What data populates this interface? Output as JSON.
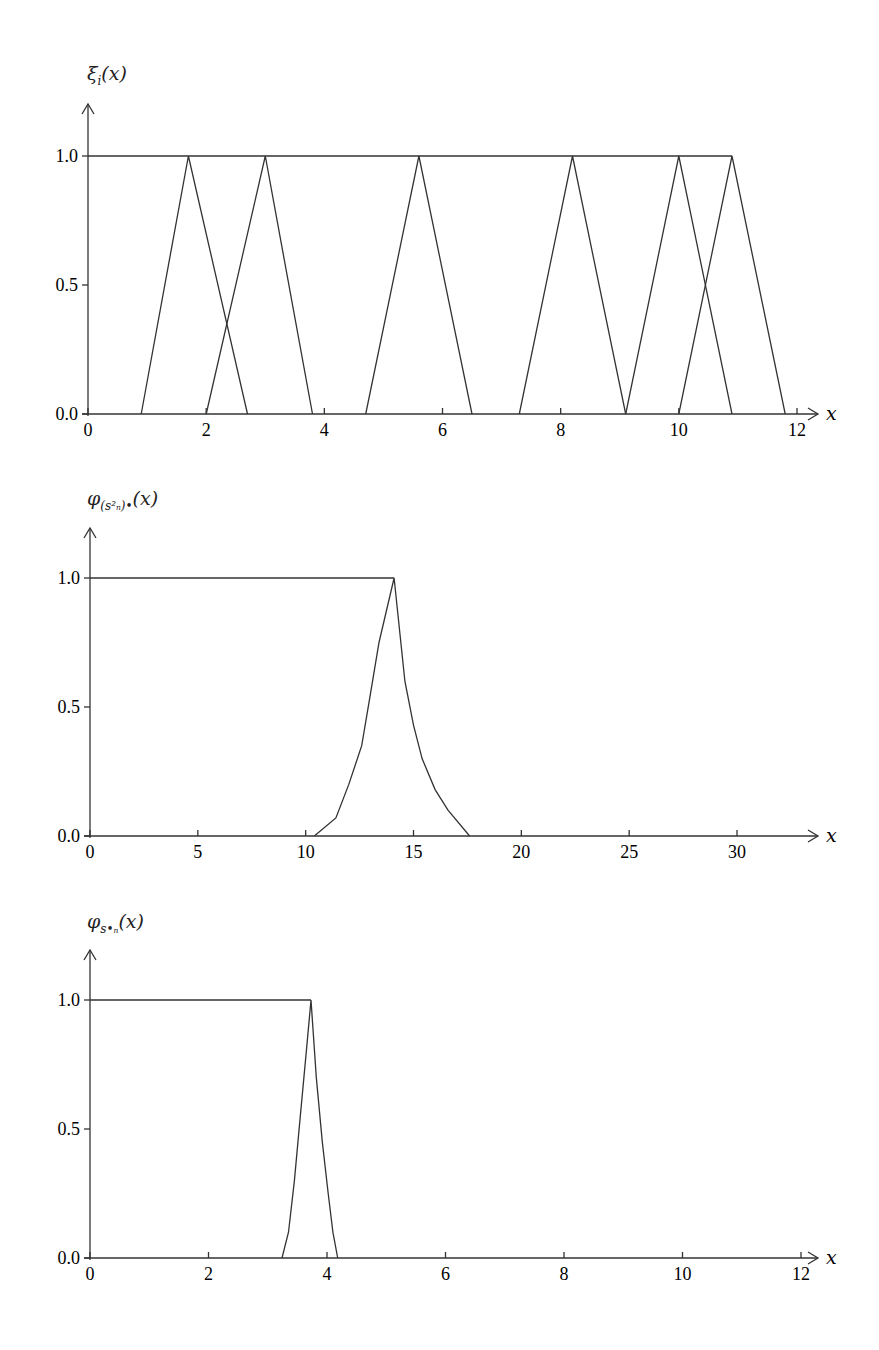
{
  "chart_data": [
    {
      "type": "line",
      "title": "ξi(x)",
      "ylabel": "ξ_i(x)",
      "xlabel": "x",
      "xlim": [
        0,
        12
      ],
      "ylim": [
        0,
        1
      ],
      "xticks": [
        0,
        2,
        4,
        6,
        8,
        10,
        12
      ],
      "yticks": [
        0.0,
        0.5,
        1.0
      ],
      "grid": false,
      "series": [
        {
          "name": "upper boundary",
          "x": [
            0,
            10.9
          ],
          "y": [
            1,
            1
          ]
        },
        {
          "name": "tri1",
          "x": [
            0.9,
            1.7,
            2.7
          ],
          "y": [
            0,
            1,
            0
          ]
        },
        {
          "name": "tri2",
          "x": [
            2.0,
            3.0,
            3.8
          ],
          "y": [
            0,
            1,
            0
          ]
        },
        {
          "name": "tri3",
          "x": [
            4.7,
            5.6,
            6.5
          ],
          "y": [
            0,
            1,
            0
          ]
        },
        {
          "name": "tri4",
          "x": [
            7.3,
            8.2,
            9.1
          ],
          "y": [
            0,
            1,
            0
          ]
        },
        {
          "name": "tri5",
          "x": [
            9.1,
            10.0,
            10.9
          ],
          "y": [
            0,
            1,
            0
          ]
        },
        {
          "name": "tri6",
          "x": [
            10.0,
            10.9,
            11.8
          ],
          "y": [
            0,
            1,
            0
          ]
        }
      ]
    },
    {
      "type": "line",
      "title": "φ(s_n^2)*(x)",
      "ylabel": "φ_(s_n^2)*(x)",
      "xlabel": "x",
      "xlim": [
        0,
        32
      ],
      "ylim": [
        0,
        1
      ],
      "xticks": [
        0,
        5,
        10,
        15,
        20,
        25,
        30
      ],
      "yticks": [
        0.0,
        0.5,
        1.0
      ],
      "grid": false,
      "series": [
        {
          "name": "upper boundary",
          "x": [
            0,
            14.1
          ],
          "y": [
            1,
            1
          ]
        },
        {
          "name": "membership",
          "x": [
            10.4,
            11.4,
            12.0,
            12.6,
            13.0,
            13.4,
            14.1,
            14.6,
            15.0,
            15.4,
            16.0,
            16.6,
            17.6
          ],
          "y": [
            0,
            0.07,
            0.2,
            0.35,
            0.55,
            0.75,
            1.0,
            0.6,
            0.43,
            0.3,
            0.18,
            0.1,
            0
          ]
        }
      ]
    },
    {
      "type": "line",
      "title": "φs_n*(x)",
      "ylabel": "φ_(s_n*)(x)",
      "xlabel": "x",
      "xlim": [
        0,
        12
      ],
      "ylim": [
        0,
        1
      ],
      "xticks": [
        0,
        2,
        4,
        6,
        8,
        10,
        12
      ],
      "yticks": [
        0.0,
        0.5,
        1.0
      ],
      "grid": false,
      "series": [
        {
          "name": "upper boundary",
          "x": [
            0,
            3.73
          ],
          "y": [
            1,
            1
          ]
        },
        {
          "name": "membership",
          "x": [
            3.24,
            3.35,
            3.45,
            3.55,
            3.65,
            3.73,
            3.82,
            3.92,
            4.02,
            4.1,
            4.18
          ],
          "y": [
            0,
            0.1,
            0.3,
            0.55,
            0.8,
            1.0,
            0.7,
            0.45,
            0.25,
            0.1,
            0
          ]
        }
      ]
    }
  ],
  "labels": {
    "p1_title": "ξ",
    "p1_sub": "i",
    "p1_arg": "(x)",
    "p2_title": "φ",
    "p2_sub": "(s²ₙ)•",
    "p2_arg": "(x)",
    "p3_title": "φ",
    "p3_sub": "s•ₙ",
    "p3_arg": "(x)",
    "x_axis": "x"
  }
}
